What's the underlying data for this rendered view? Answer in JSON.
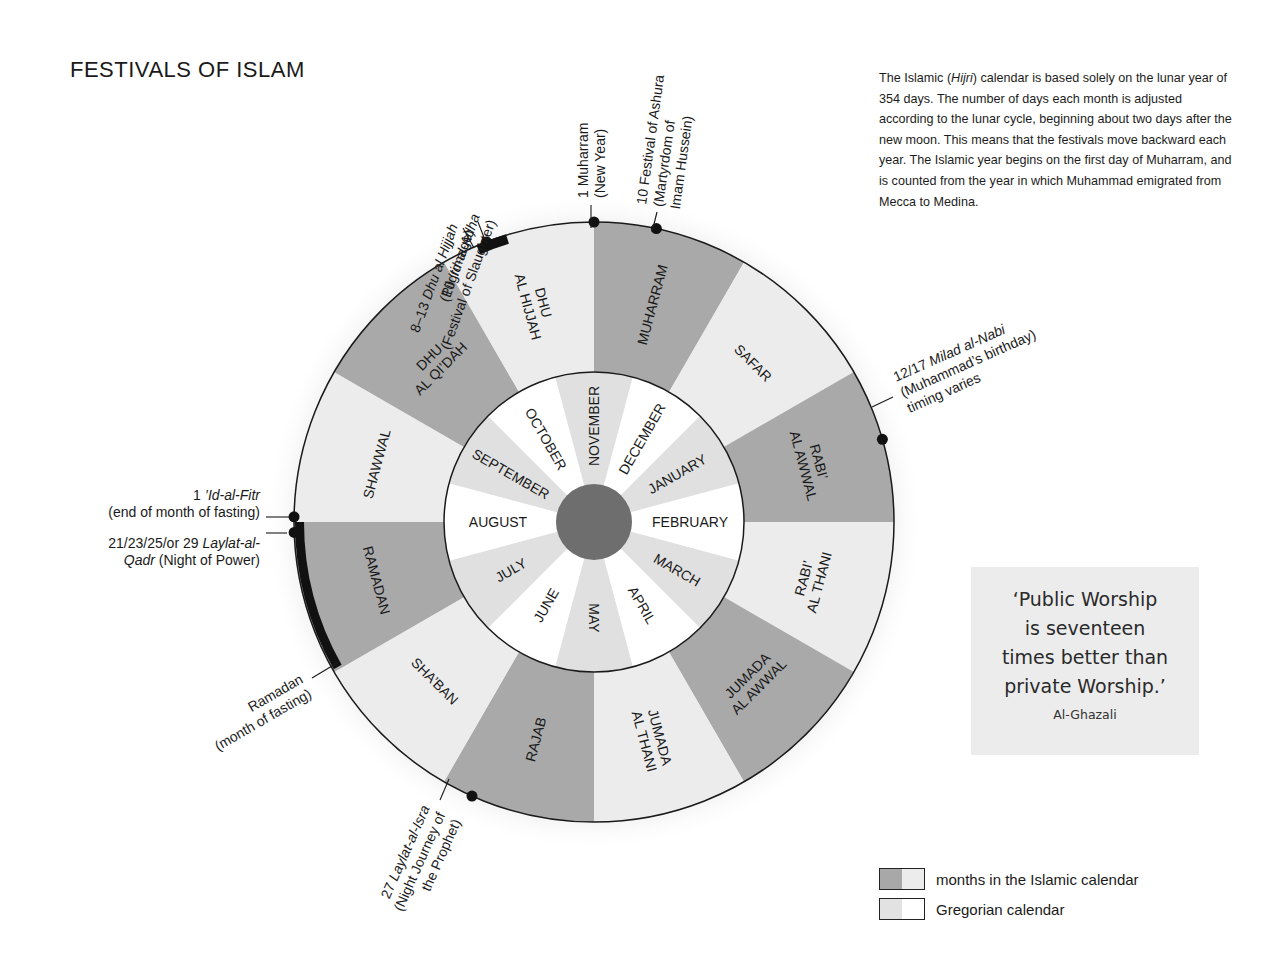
{
  "title": "FESTIVALS OF ISLAM",
  "intro": {
    "parts": [
      "The Islamic (",
      "Hijri",
      ") calendar is based solely on the lunar year of 354 days. The number of days each month is adjusted according to the lunar cycle, beginning about two days after the new moon. This means that the festivals move backward each year. The Islamic year begins on the first day of Muharram, and is counted from the year in which Muhammad emigrated from Mecca to Medina."
    ]
  },
  "quote": {
    "lines": [
      "‘Public Worship",
      "is seventeen",
      "times better than",
      "private Worship.’"
    ],
    "author": "Al-Ghazali"
  },
  "legend": {
    "items": [
      {
        "label": "months in the Islamic calendar",
        "colors": [
          "#a8a8a8",
          "#ececec"
        ]
      },
      {
        "label": "Gregorian calendar",
        "colors": [
          "#e2e2e2",
          "#ffffff"
        ]
      }
    ]
  },
  "colors": {
    "islamic_dark": "#a9a9a9",
    "islamic_light": "#ececec",
    "greg_light": "#e0e0e0",
    "greg_white": "#ffffff",
    "center": "#6e6e6e",
    "marker": "#111111"
  },
  "chart_data": {
    "type": "radial-calendar",
    "title": "FESTIVALS OF ISLAM",
    "islamic_months": [
      {
        "name": [
          "MUHARRAM"
        ],
        "shade": "dark"
      },
      {
        "name": [
          "SAFAR"
        ],
        "shade": "light"
      },
      {
        "name": [
          "RABI’",
          "AL AWWAL"
        ],
        "shade": "dark"
      },
      {
        "name": [
          "RABI’",
          "AL THANI"
        ],
        "shade": "light"
      },
      {
        "name": [
          "JUMADA",
          "AL AWWAL"
        ],
        "shade": "dark"
      },
      {
        "name": [
          "JUMADA",
          "AL THANI"
        ],
        "shade": "light"
      },
      {
        "name": [
          "RAJAB"
        ],
        "shade": "dark"
      },
      {
        "name": [
          "SHA’BAN"
        ],
        "shade": "light"
      },
      {
        "name": [
          "RAMADAN"
        ],
        "shade": "dark"
      },
      {
        "name": [
          "SHAWWAL"
        ],
        "shade": "light"
      },
      {
        "name": [
          "DHU",
          "AL QI’DAH"
        ],
        "shade": "dark"
      },
      {
        "name": [
          "DHU",
          "AL HIJJAH"
        ],
        "shade": "light"
      }
    ],
    "gregorian_months": [
      "NOVEMBER",
      "DECEMBER",
      "JANUARY",
      "FEBRUARY",
      "MARCH",
      "APRIL",
      "MAY",
      "JUNE",
      "JULY",
      "AUGUST",
      "SEPTEMBER",
      "OCTOBER"
    ],
    "festivals": [
      {
        "lines": [
          "1 Muharram",
          "(New Year)"
        ]
      },
      {
        "lines": [
          "10 Festival of Ashura",
          "(Martyrdom of",
          "Imam Hussein)"
        ]
      },
      {
        "lines": [
          "12/17 Milad al-Nabi",
          "(Muhammad’s birthday)",
          "timing varies"
        ]
      },
      {
        "lines": [
          "27 Laylat-al-Isra",
          "(Night Journey of",
          "the Prophet)"
        ]
      },
      {
        "lines": [
          "Ramadan",
          "(month of fasting)"
        ]
      },
      {
        "lines": [
          "1 ’Id-al-Fitr",
          "(end of month of fasting)"
        ]
      },
      {
        "lines": [
          "21/23/25/or 29 Laylat-al-",
          "Qadr (Night of Power)"
        ]
      },
      {
        "lines": [
          "10 ’Id-al-Adha",
          "(Festival of Slaughter)"
        ]
      },
      {
        "lines": [
          "8–13 Dhu al Hijjah",
          "(Pilgrimage)"
        ]
      }
    ]
  }
}
